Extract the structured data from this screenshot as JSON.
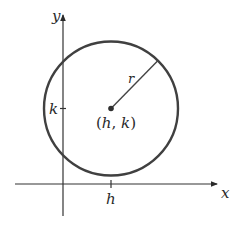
{
  "diagram": {
    "axes": {
      "x_label": "x",
      "y_label": "y"
    },
    "center": {
      "label_open": "(",
      "h": "h",
      "comma": ", ",
      "k": "k",
      "label_close": ")"
    },
    "radius_label": "r",
    "ticks": {
      "h_label": "h",
      "k_label": "k"
    },
    "colors": {
      "stroke": "#3a3a3a",
      "circle": "#404040",
      "text": "#2a2a2a",
      "background": "#ffffff"
    }
  }
}
